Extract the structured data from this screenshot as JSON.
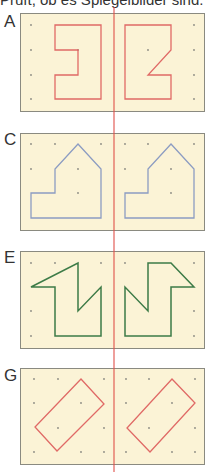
{
  "caption": "Prüft, ob es Spiegelbilder sind.",
  "colors": {
    "panel_bg": "#fbf3d6",
    "panel_border": "#8a8a80",
    "mirror_line": "#e0504a",
    "dot": "#8a8a80",
    "red": "#e06a66",
    "blue": "#8c9cc2",
    "green": "#3d7b47"
  },
  "panels": [
    {
      "label": "A",
      "color": "red"
    },
    {
      "label": "C",
      "color": "blue"
    },
    {
      "label": "E",
      "color": "green"
    },
    {
      "label": "G",
      "color": "red"
    }
  ]
}
